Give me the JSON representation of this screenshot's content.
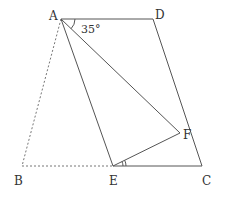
{
  "diagram": {
    "type": "geometry-figure",
    "colors": {
      "line": "#555555",
      "dashed": "#777777",
      "text": "#333333",
      "background": "#ffffff"
    },
    "points": {
      "A": {
        "label": "A",
        "x": 61,
        "y": 19
      },
      "B": {
        "label": "B",
        "x": 22,
        "y": 166
      },
      "C": {
        "label": "C",
        "x": 202,
        "y": 166
      },
      "D": {
        "label": "D",
        "x": 153,
        "y": 19
      },
      "E": {
        "label": "E",
        "x": 113,
        "y": 166
      },
      "F": {
        "label": "F",
        "x": 180,
        "y": 133
      }
    },
    "segments": {
      "solid": [
        "AD",
        "DC",
        "AE",
        "AF",
        "EF",
        "EC"
      ],
      "dashed": [
        "AB",
        "BE"
      ]
    },
    "angles": [
      {
        "vertex": "A",
        "between": [
          "AD",
          "AF"
        ],
        "label": "35°",
        "marks": 1
      },
      {
        "vertex": "E",
        "between": [
          "EC",
          "EF"
        ],
        "label": "",
        "marks": 2
      }
    ]
  }
}
